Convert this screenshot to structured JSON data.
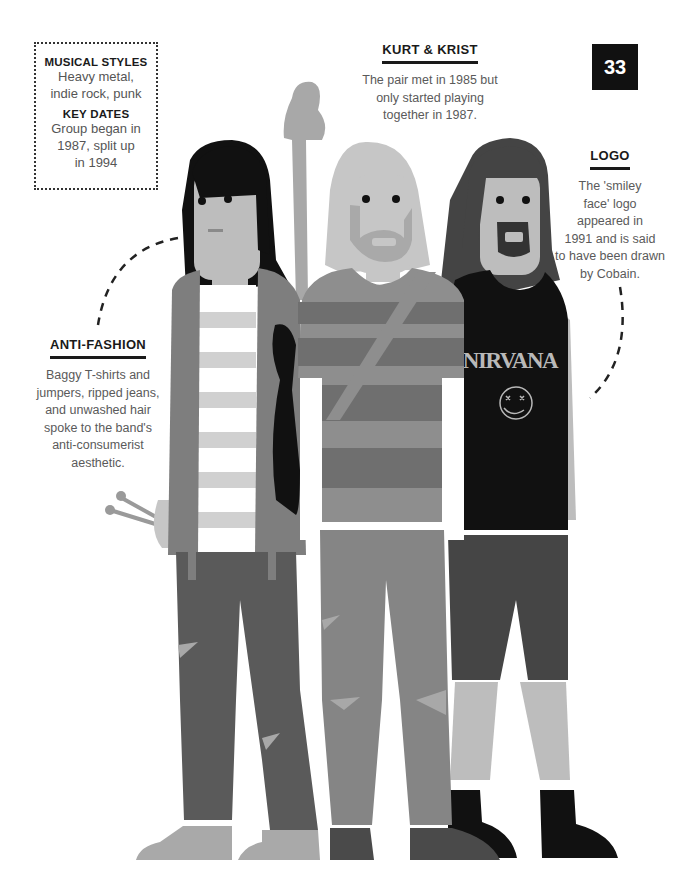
{
  "page_number": "33",
  "info_box": {
    "musical_styles_heading": "MUSICAL STYLES",
    "musical_styles_lines": [
      "Heavy metal,",
      "indie rock, punk"
    ],
    "key_dates_heading": "KEY DATES",
    "key_dates_lines": [
      "Group began in",
      "1987, split up",
      "in 1994"
    ]
  },
  "callouts": {
    "kurt_krist": {
      "heading": "KURT & KRIST",
      "lines": [
        "The pair met in 1985 but",
        "only started playing",
        "together in 1987."
      ]
    },
    "logo": {
      "heading": "LOGO",
      "lines": [
        "The 'smiley",
        "face' logo",
        "appeared in",
        "1991 and is said",
        "to have been drawn",
        "by Cobain."
      ]
    },
    "anti_fashion": {
      "heading": "ANTI-FASHION",
      "lines": [
        "Baggy T-shirts and",
        "jumpers, ripped jeans,",
        "and unwashed hair",
        "spoke to the band's",
        "anti-consumerist",
        "aesthetic."
      ]
    }
  },
  "illustration": {
    "shirt_text": "NIRVANA",
    "band_members": [
      "drummer-left",
      "guitarist-center",
      "bassist-right"
    ],
    "palette": {
      "black": "#111111",
      "hair_dark": "#444444",
      "skin": "#bdbdbd",
      "skin_light": "#c6c6c6",
      "jacket": "#7e7e7e",
      "stripe_light": "#d0d0d0",
      "shirt_dark": "#6f6f6f",
      "shirt_light": "#8e8e8e",
      "jeans_dark": "#5a5a5a",
      "jeans_mid": "#858585",
      "shorts": "#454545",
      "shoe": "#a9a9a9"
    }
  }
}
